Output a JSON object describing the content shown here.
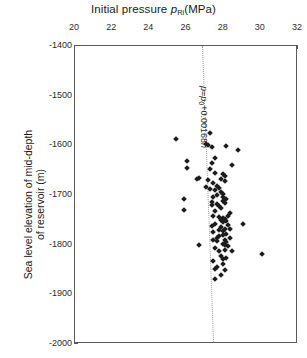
{
  "chart_data": {
    "type": "scatter",
    "title_main": "Initial pressure ",
    "title_var": "p",
    "title_var_sub": "Ri",
    "title_units": "(MPa)",
    "xlabel": "Initial pressure p_Ri (MPa)",
    "ylabel": "Sea level elevation of mid-depth of reservoir (m)",
    "ylabel_line1": "Sea level elevation of mid-depth",
    "ylabel_line2": "of reservoir (m)",
    "xlim": [
      20,
      32
    ],
    "ylim": [
      -2000,
      -1400
    ],
    "x_axis_position": "top",
    "y_axis_direction": "decreasing-downward",
    "xticks": [
      20,
      22,
      24,
      26,
      28,
      30,
      32
    ],
    "xtick_labels": [
      "20",
      "22",
      "24",
      "26",
      "28",
      "30",
      "32"
    ],
    "yticks": [
      -1400,
      -1500,
      -1600,
      -1700,
      -1800,
      -1900,
      -2000
    ],
    "ytick_labels": [
      "-1400",
      "-1500",
      "-1600",
      "-1700",
      "-1800",
      "-1900",
      "-2000"
    ],
    "grid": false,
    "legend": null,
    "marker": "diamond",
    "marker_color": "#1c1c1c",
    "frame_color": "#5a5a5a",
    "annotations": [
      {
        "text": "p=p0+0.00168h",
        "text_main1": "p",
        "text_eq": "=",
        "text_main2": "p",
        "text_sub": "0",
        "text_main3": "+0.00168",
        "text_var": "h",
        "orientation": "vertical",
        "x": 27.2,
        "y": -1480
      }
    ],
    "trend_line": {
      "style": "dotted",
      "color": "#9a9a9a",
      "equation": "p = p0 + 0.00168h",
      "x_at_top": 26.85,
      "y_top": -1400,
      "x_at_bottom": 27.45,
      "y_bottom": -2000
    },
    "points": [
      [
        27.25,
        -1576
      ],
      [
        25.45,
        -1587
      ],
      [
        27.05,
        -1597
      ],
      [
        27.15,
        -1600
      ],
      [
        27.35,
        -1604
      ],
      [
        28.15,
        -1601
      ],
      [
        28.75,
        -1610
      ],
      [
        27.55,
        -1625
      ],
      [
        26.05,
        -1632
      ],
      [
        27.35,
        -1636
      ],
      [
        28.45,
        -1640
      ],
      [
        26.05,
        -1645
      ],
      [
        27.25,
        -1648
      ],
      [
        27.55,
        -1655
      ],
      [
        27.95,
        -1658
      ],
      [
        28.05,
        -1662
      ],
      [
        26.55,
        -1667
      ],
      [
        26.65,
        -1665
      ],
      [
        27.15,
        -1670
      ],
      [
        27.85,
        -1668
      ],
      [
        28.05,
        -1672
      ],
      [
        27.45,
        -1676
      ],
      [
        27.65,
        -1682
      ],
      [
        27.75,
        -1686
      ],
      [
        27.55,
        -1690
      ],
      [
        27.85,
        -1693
      ],
      [
        27.95,
        -1697
      ],
      [
        27.65,
        -1700
      ],
      [
        25.85,
        -1708
      ],
      [
        27.45,
        -1705
      ],
      [
        27.95,
        -1712
      ],
      [
        28.05,
        -1716
      ],
      [
        27.35,
        -1720
      ],
      [
        27.75,
        -1722
      ],
      [
        27.85,
        -1726
      ],
      [
        25.85,
        -1730
      ],
      [
        27.55,
        -1733
      ],
      [
        28.35,
        -1737
      ],
      [
        27.45,
        -1742
      ],
      [
        27.75,
        -1745
      ],
      [
        28.05,
        -1748
      ],
      [
        28.15,
        -1752
      ],
      [
        27.95,
        -1755
      ],
      [
        27.55,
        -1758
      ],
      [
        27.35,
        -1762
      ],
      [
        29.05,
        -1758
      ],
      [
        27.85,
        -1765
      ],
      [
        28.05,
        -1768
      ],
      [
        27.95,
        -1772
      ],
      [
        27.45,
        -1775
      ],
      [
        28.15,
        -1778
      ],
      [
        27.75,
        -1782
      ],
      [
        28.35,
        -1786
      ],
      [
        28.05,
        -1790
      ],
      [
        27.65,
        -1793
      ],
      [
        26.65,
        -1800
      ],
      [
        27.95,
        -1798
      ],
      [
        28.25,
        -1802
      ],
      [
        27.55,
        -1806
      ],
      [
        28.05,
        -1810
      ],
      [
        28.45,
        -1812
      ],
      [
        30.05,
        -1818
      ],
      [
        27.85,
        -1822
      ],
      [
        28.15,
        -1826
      ],
      [
        27.45,
        -1833
      ],
      [
        27.95,
        -1838
      ],
      [
        27.65,
        -1845
      ],
      [
        28.05,
        -1852
      ],
      [
        27.85,
        -1862
      ],
      [
        27.55,
        -1870
      ],
      [
        27.05,
        -1683
      ],
      [
        27.25,
        -1688
      ],
      [
        27.95,
        -1704
      ],
      [
        28.15,
        -1709
      ],
      [
        27.35,
        -1714
      ],
      [
        27.65,
        -1718
      ],
      [
        28.25,
        -1742
      ],
      [
        27.95,
        -1746
      ],
      [
        27.85,
        -1750
      ],
      [
        28.25,
        -1760
      ],
      [
        27.75,
        -1770
      ],
      [
        28.35,
        -1768
      ],
      [
        27.65,
        -1786
      ],
      [
        27.95,
        -1780
      ],
      [
        28.15,
        -1795
      ],
      [
        27.45,
        -1790
      ],
      [
        28.05,
        -1800
      ],
      [
        27.75,
        -1812
      ],
      [
        27.95,
        -1828
      ],
      [
        27.55,
        -1848
      ]
    ]
  },
  "caption": {
    "text": ""
  }
}
